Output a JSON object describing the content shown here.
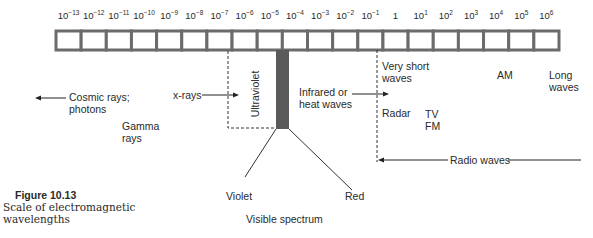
{
  "scale": {
    "ticks": [
      {
        "base": "10",
        "exp": "−13"
      },
      {
        "base": "10",
        "exp": "−12"
      },
      {
        "base": "10",
        "exp": "−11"
      },
      {
        "base": "10",
        "exp": "−10"
      },
      {
        "base": "10",
        "exp": "−9"
      },
      {
        "base": "10",
        "exp": "−8"
      },
      {
        "base": "10",
        "exp": "−7"
      },
      {
        "base": "10",
        "exp": "−6"
      },
      {
        "base": "10",
        "exp": "−5"
      },
      {
        "base": "10",
        "exp": "−4"
      },
      {
        "base": "10",
        "exp": "−3"
      },
      {
        "base": "10",
        "exp": "−2"
      },
      {
        "base": "10",
        "exp": "−1"
      },
      {
        "base": "1",
        "exp": ""
      },
      {
        "base": "10",
        "exp": "1"
      },
      {
        "base": "10",
        "exp": "2"
      },
      {
        "base": "10",
        "exp": "3"
      },
      {
        "base": "10",
        "exp": "4"
      },
      {
        "base": "10",
        "exp": "5"
      },
      {
        "base": "10",
        "exp": "6"
      }
    ],
    "cell_count": 20
  },
  "labels": {
    "cosmic_line1": "Cosmic rays;",
    "cosmic_line2": "photons",
    "gamma_line1": "Gamma",
    "gamma_line2": "rays",
    "xrays": "x-rays",
    "ultraviolet": "Ultraviolet",
    "infrared_line1": "Infrared or",
    "infrared_line2": "heat waves",
    "very_short_line1": "Very short",
    "very_short_line2": "waves",
    "radar": "Radar",
    "tv": "TV",
    "fm": "FM",
    "am": "AM",
    "long_line1": "Long",
    "long_line2": "waves",
    "radio_waves": "Radio waves",
    "violet": "Violet",
    "red": "Red",
    "visible_spectrum": "Visible spectrum"
  },
  "caption": {
    "title": "Figure 10.13",
    "line1": "Scale of electromagnetic",
    "line2": "wavelengths"
  },
  "colors": {
    "bar_stroke": "#6b6b6b",
    "visible_band": "#5a5a5a",
    "text": "#2a2a2a"
  }
}
